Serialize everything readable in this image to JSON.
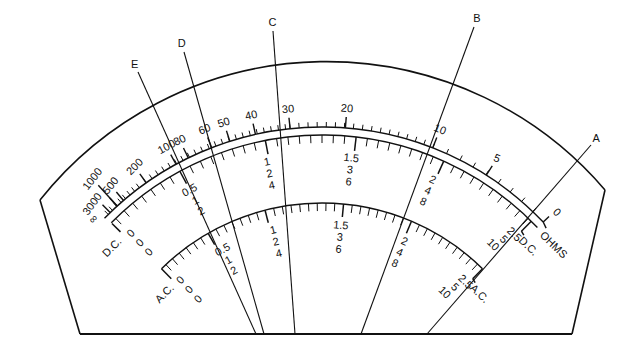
{
  "geometry": {
    "center": [
      322,
      432
    ],
    "outer_radius": 366,
    "ohms_band_outer_radius": 305,
    "ohms_band_inner_radius": 297,
    "ac_arc_radius": 229,
    "bottom_y": 334,
    "left_corner": [
      40,
      200
    ],
    "right_corner": [
      605,
      190
    ],
    "bottom_left": [
      80,
      334
    ],
    "bottom_right": [
      572,
      334
    ]
  },
  "scales": {
    "ohms": {
      "name": "OHMS",
      "labels": [
        {
          "text": "∞",
          "angle": -45.5
        },
        {
          "text": "3000",
          "angle": -44.0
        },
        {
          "text": "1000",
          "angle": -42.2
        },
        {
          "text": "500",
          "angle": -40.6
        },
        {
          "text": "200",
          "angle": -35.2
        },
        {
          "text": "100",
          "angle": -28.6
        },
        {
          "text": "80",
          "angle": -26.0
        },
        {
          "text": "60",
          "angle": -21.2
        },
        {
          "text": "50",
          "angle": -17.6
        },
        {
          "text": "40",
          "angle": -12.6
        },
        {
          "text": "30",
          "angle": -6.0
        },
        {
          "text": "20",
          "angle": 4.4
        },
        {
          "text": "10",
          "angle": 21.3
        },
        {
          "text": "5",
          "angle": 32.6
        },
        {
          "text": "0",
          "angle": 46.0
        }
      ],
      "end_label": "OHMS"
    },
    "dc": {
      "name": "D.C.",
      "start_label": "D.C.",
      "end_label": "D.C.",
      "left_zeros": [
        "0",
        "0",
        "0"
      ],
      "columns": [
        {
          "values": [
            "0.5",
            "1",
            "2"
          ],
          "angle": -29.0
        },
        {
          "values": [
            "1",
            "2",
            "4"
          ],
          "angle": -11.8
        },
        {
          "values": [
            "1.5",
            "3",
            "6"
          ],
          "angle": 5.8
        },
        {
          "values": [
            "2",
            "4",
            "8"
          ],
          "angle": 23.4
        }
      ],
      "right_values": [
        "2.5",
        "5",
        "10"
      ]
    },
    "ac": {
      "name": "A.C.",
      "start_label": "A.C.",
      "end_label": "A.C.",
      "left_zeros": [
        "0",
        "0",
        "0"
      ],
      "columns": [
        {
          "values": [
            "0.5",
            "1",
            "2"
          ],
          "angle": -29.0
        },
        {
          "values": [
            "1",
            "2",
            "4"
          ],
          "angle": -14.0
        },
        {
          "values": [
            "1.5",
            "3",
            "6"
          ],
          "angle": 4.8
        },
        {
          "values": [
            "2",
            "4",
            "8"
          ],
          "angle": 23.0
        }
      ],
      "right_values": [
        "2.5",
        "5",
        "10"
      ]
    }
  },
  "pointers": [
    {
      "label": "A",
      "top": [
        591,
        145
      ],
      "bottom": [
        427,
        334
      ]
    },
    {
      "label": "B",
      "top": [
        474,
        27
      ],
      "bottom": [
        361,
        334
      ]
    },
    {
      "label": "C",
      "top": [
        273,
        31
      ],
      "bottom": [
        295,
        334
      ]
    },
    {
      "label": "D",
      "top": [
        184,
        52
      ],
      "bottom": [
        264,
        334
      ]
    },
    {
      "label": "E",
      "top": [
        138,
        72
      ],
      "bottom": [
        256,
        334
      ]
    }
  ]
}
